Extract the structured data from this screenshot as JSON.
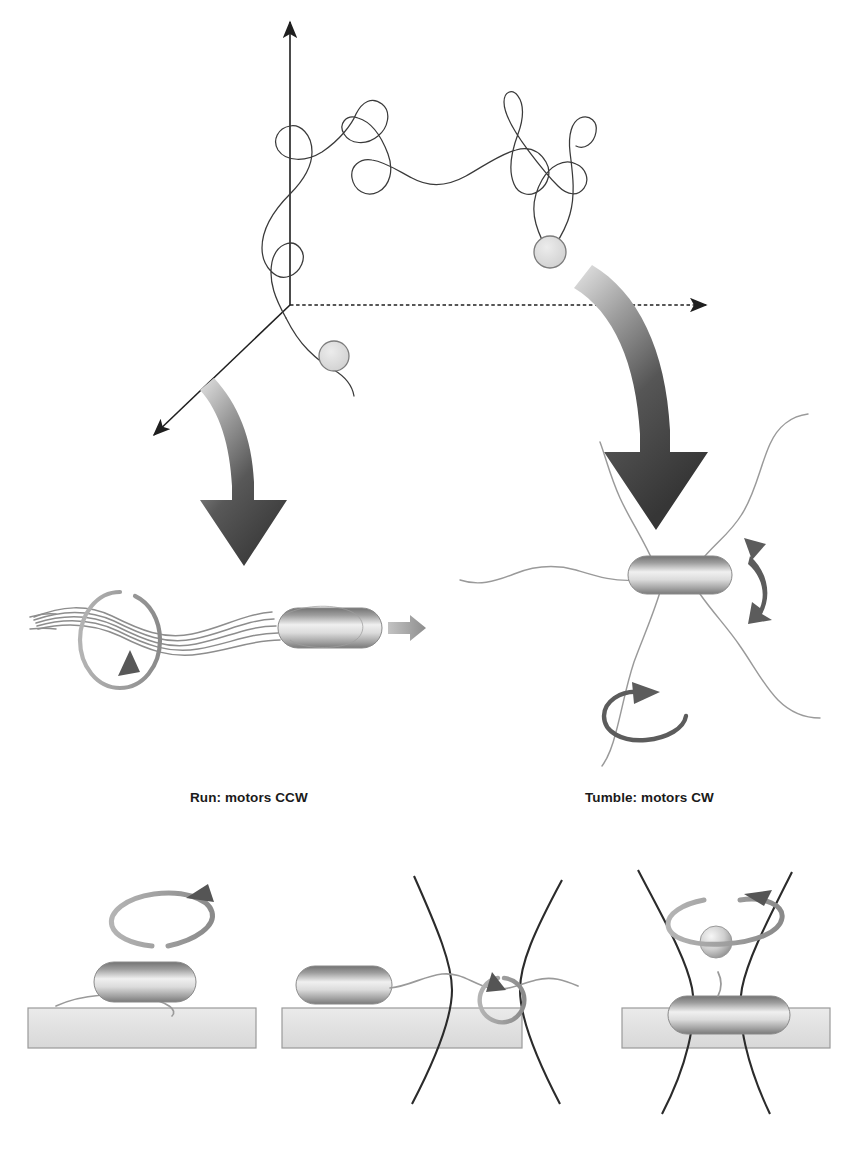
{
  "figure": {
    "background_color": "#ffffff"
  },
  "panel_top": {
    "name": "random-walk-trajectory-panel",
    "description": "Three-dimensional random walk trajectory of a swimming bacterium",
    "axes": {
      "origin": {
        "x": 290,
        "y": 305
      },
      "z_axis": {
        "label": "",
        "tip": {
          "x": 290,
          "y": 20
        }
      },
      "x_axis": {
        "label": "",
        "tip": {
          "x": 712,
          "y": 305
        }
      },
      "y_axis": {
        "label": "",
        "tip": {
          "x": 148,
          "y": 440
        }
      },
      "x_axis_style": "dashed",
      "z_axis_style": "solid",
      "y_axis_style": "solid"
    },
    "markers": [
      {
        "name": "bacterium-position-marker-lower",
        "x": 334,
        "y": 356,
        "r": 15,
        "fill": "#dcdcdc",
        "stroke": "#777777"
      },
      {
        "name": "bacterium-position-marker-upper",
        "x": 550,
        "y": 252,
        "r": 16,
        "fill": "#dcdcdc",
        "stroke": "#777777"
      }
    ],
    "trajectory_color": "#3a3a3a",
    "trajectory_width": 1.3
  },
  "pointer_arrows": [
    {
      "name": "curved-arrow-to-run",
      "gradient_from": "#cfcfcf",
      "gradient_to": "#3f3f3f"
    },
    {
      "name": "curved-arrow-to-tumble",
      "gradient_from": "#d4d4d4",
      "gradient_to": "#3a3a3a"
    }
  ],
  "panel_run": {
    "name": "run-state-panel",
    "label": "Run: motors CCW",
    "label_position": {
      "x": 190,
      "y": 802
    },
    "elements": {
      "cell_body": "bacterium-body-rod",
      "flagella": "flagellar-bundle-helix",
      "bundle_strands": 5,
      "rotation_loop": "ccw-rotation-ellipse",
      "motion_arrow": "forward-propulsion-arrow"
    },
    "colors": {
      "body_light": "#f4f4f4",
      "body_mid": "#b8b8b8",
      "body_dark": "#6e6e6e",
      "flagella": "#8d8d8d",
      "rotation_arrow": "#8a8a8a",
      "motion_arrow": "#9a9a9a"
    }
  },
  "panel_tumble": {
    "name": "tumble-state-panel",
    "label": "Tumble: motors CW",
    "label_position": {
      "x": 585,
      "y": 802
    },
    "elements": {
      "cell_body": "bacterium-body-rod",
      "flagella": "splayed-flagella",
      "flagella_count": 5,
      "wobble_arrow": "double-headed-wobble-arrow",
      "rotation_loop": "cw-rotation-loop-arrow"
    },
    "colors": {
      "body_light": "#f4f4f4",
      "body_mid": "#b0b0b0",
      "body_dark": "#6a6a6a",
      "flagella": "#9a9a9a",
      "dark_arrow": "#595959"
    }
  },
  "panel_assays": {
    "name": "single-motor-assay-row",
    "slab_fill": "#e3e3e3",
    "slab_stroke": "#9a9a9a",
    "laser_color": "#2b2b2b",
    "rotation_arrow_color": "#8f8f8f",
    "arrow_head_color": "#555555",
    "items": [
      {
        "name": "assay-tethered-cell",
        "description": "Tethered cell assay: cell body rotates about a surface-anchored flagellum",
        "slab": {
          "x": 28,
          "y": 1008,
          "w": 228,
          "h": 40
        },
        "rotation": "ccw-body-rotation-loop",
        "has_laser_trap": false,
        "has_bead": false
      },
      {
        "name": "assay-optical-trap-flagellum",
        "description": "Optical trap holding the flagellar filament of a surface-adhered cell",
        "slab": {
          "x": 282,
          "y": 1008,
          "w": 240,
          "h": 40
        },
        "rotation": "flagellum-rotation-loop",
        "has_laser_trap": true,
        "has_bead": false
      },
      {
        "name": "assay-bead-in-optical-trap",
        "description": "Bead assay: a micro-bead attached to a truncated flagellum held in an optical trap",
        "slab": {
          "x": 622,
          "y": 1008,
          "w": 208,
          "h": 40
        },
        "rotation": "bead-rotation-loop",
        "has_laser_trap": true,
        "has_bead": true,
        "bead": {
          "cx": 716,
          "cy": 942,
          "r": 16
        }
      }
    ]
  },
  "bottom_caption": {
    "name": "cropped-caption-text",
    "text": ""
  }
}
